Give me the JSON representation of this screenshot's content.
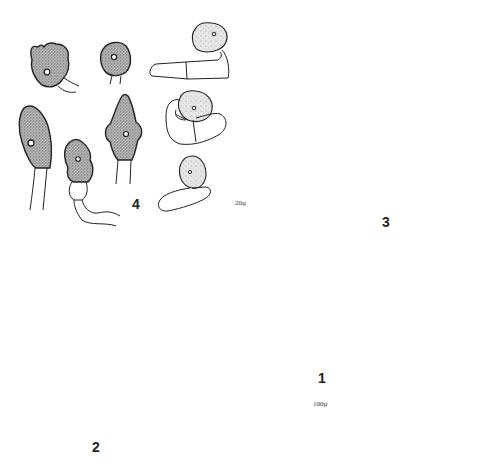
{
  "plate": {
    "type": "scientific-illustration",
    "figures": [
      {
        "id": "1",
        "label": "1",
        "description": "cross-section of fruiting body on substrate",
        "scale_bar": "100µ"
      },
      {
        "id": "2",
        "label": "2",
        "description": "basidia with sterigmata arising from subhymenial cells"
      },
      {
        "id": "3",
        "label": "3",
        "description": "nine elongate-ellipsoid basidiospores in outline"
      },
      {
        "id": "4",
        "label": "4",
        "description": "stippled cystidia / conidia on hyphae with central nucleus"
      }
    ],
    "scale_bars": {
      "fig_2_3_4": "20µ",
      "fig_1": "100µ"
    }
  },
  "colors": {
    "ink": "#222222",
    "stipple_fill": "#9a9a9a",
    "background": "#ffffff"
  }
}
